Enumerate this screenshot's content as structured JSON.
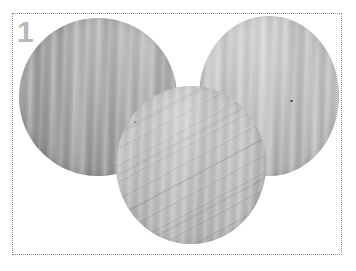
{
  "panel": {
    "number_label": "1",
    "number_color": "#b9b9b9",
    "background_color": "#ffffff",
    "frame_style": "dotted",
    "frame_color": "#8c8c8c"
  },
  "subject": {
    "description": "three overlapping circular metallic discs with striated surfaces",
    "count": 3,
    "discs": [
      {
        "name": "left-disc",
        "tone": "#9fa0a0",
        "texture": "vertical-wavy-striations",
        "layer": "back"
      },
      {
        "name": "right-disc",
        "tone": "#b4b5b4",
        "texture": "vertical-wavy-striations",
        "layer": "middle"
      },
      {
        "name": "front-disc",
        "tone": "#b0b1b0",
        "texture": "diagonal-scratch-lines",
        "layer": "front"
      }
    ]
  }
}
